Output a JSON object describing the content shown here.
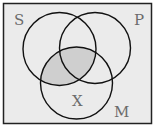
{
  "diagram": {
    "type": "venn",
    "background": "#ebebeb",
    "frame_color": "#222222",
    "circle_stroke": "#111111",
    "shade_color": "#cfcfcf",
    "shaded_region": "S ∩ M",
    "sets": [
      {
        "id": "S",
        "label": "S",
        "cx": 59.5,
        "cy": 49,
        "r": 36.5
      },
      {
        "id": "P",
        "label": "P",
        "cx": 95,
        "cy": 48,
        "r": 35.5
      },
      {
        "id": "M",
        "label": "M",
        "cx": 76.5,
        "cy": 83,
        "r": 36
      }
    ],
    "labels": {
      "S": "S",
      "P": "P",
      "M": "M",
      "X": "X"
    }
  }
}
